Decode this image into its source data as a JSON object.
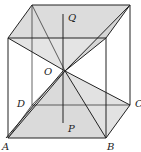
{
  "diagram": {
    "type": "cube with two pyramids sharing apex at center",
    "labels": {
      "Q": "Q",
      "O": "O",
      "D": "D",
      "C": "C",
      "P": "P",
      "A": "A",
      "B": "B"
    },
    "colors": {
      "line": "#222222",
      "shade": "#d8d8d8",
      "background": "#ffffff"
    }
  }
}
